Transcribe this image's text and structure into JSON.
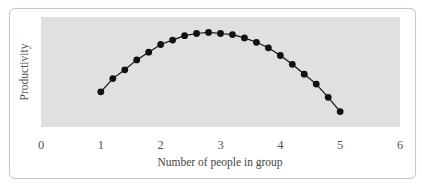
{
  "chart_data": {
    "type": "line",
    "title": "",
    "xlabel": "Number of people in group",
    "ylabel": "Productivity",
    "xlim": [
      0,
      6
    ],
    "ylim": [
      0,
      100
    ],
    "x_ticks": [
      "0",
      "1",
      "2",
      "3",
      "4",
      "5",
      "6"
    ],
    "y_ticks": [],
    "grid": false,
    "legend": null,
    "markers": "filled-circle",
    "plot_background": "#e0e0e0",
    "series": [
      {
        "name": "Productivity",
        "color": "#111111",
        "x": [
          1.0,
          1.2,
          1.4,
          1.6,
          1.8,
          2.0,
          2.2,
          2.4,
          2.6,
          2.8,
          3.0,
          3.2,
          3.4,
          3.6,
          3.8,
          4.0,
          4.2,
          4.4,
          4.6,
          4.8,
          5.0
        ],
        "values": [
          32,
          44,
          52,
          61,
          68,
          75,
          79,
          83,
          85,
          86,
          85,
          84,
          81,
          77,
          72,
          65,
          57,
          48,
          39,
          27,
          14
        ]
      }
    ]
  }
}
